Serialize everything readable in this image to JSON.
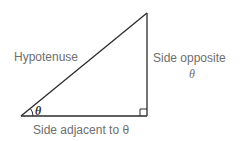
{
  "diagram": {
    "colors": {
      "stroke": "#2b2b2b",
      "label": "#6e6e6e",
      "background": "#ffffff"
    },
    "vertices": {
      "angle_vertex": [
        21,
        116
      ],
      "apex": [
        147,
        13
      ],
      "right_angle_vertex": [
        147,
        116
      ]
    },
    "labels": {
      "hypotenuse": "Hypotenuse",
      "opposite_line1": "Side opposite",
      "opposite_line2": "θ",
      "adjacent": "Side adjacent to θ",
      "angle": "θ"
    }
  }
}
